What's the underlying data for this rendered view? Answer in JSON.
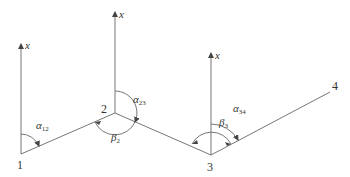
{
  "diagram": {
    "type": "traverse azimuth/angle diagram",
    "line_color": "#555555",
    "points": [
      {
        "id": "1",
        "label": "1"
      },
      {
        "id": "2",
        "label": "2"
      },
      {
        "id": "3",
        "label": "3"
      },
      {
        "id": "4",
        "label": "4"
      }
    ],
    "axes": [
      {
        "at": "1",
        "label": "x"
      },
      {
        "at": "2",
        "label": "x"
      },
      {
        "at": "3",
        "label": "x"
      }
    ],
    "angles": {
      "alpha12": {
        "symbol": "α",
        "sub": "12"
      },
      "alpha23": {
        "symbol": "α",
        "sub": "23"
      },
      "alpha34": {
        "symbol": "α",
        "sub": "34"
      },
      "beta2": {
        "symbol": "β",
        "sub": "2"
      },
      "beta3": {
        "symbol": "β",
        "sub": "3"
      }
    }
  }
}
